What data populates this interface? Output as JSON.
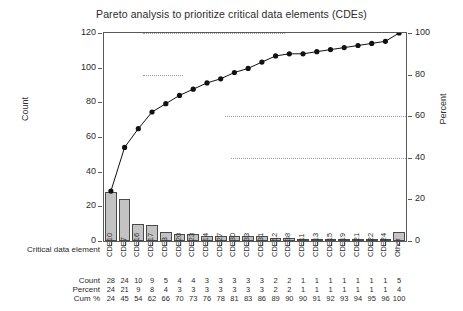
{
  "chart_data": {
    "type": "bar",
    "title": "Pareto analysis to prioritize critical data elements (CDEs)",
    "xlabel": "Critical data element",
    "ylabel": "Count",
    "y2label": "Percent",
    "ylim": [
      0,
      120
    ],
    "y2lim": [
      0,
      100
    ],
    "yticks": [
      "120",
      "100",
      "80",
      "60",
      "40",
      "20",
      "0"
    ],
    "y2ticks": [
      "100",
      "80",
      "60",
      "40",
      "20",
      "0"
    ],
    "grid": false,
    "legend": "none",
    "categories": [
      "CDE10",
      "CDE7",
      "CDE16",
      "CDE17",
      "CDE3",
      "CDE20",
      "CDE23",
      "CDE14",
      "CDE27",
      "CDE30",
      "CDE33",
      "CDE31",
      "CDE12",
      "CDE38",
      "CDE11",
      "CDE13",
      "CDE15",
      "CDE19",
      "CDE21",
      "CDE22",
      "CDE24",
      "Other"
    ],
    "values": [
      28,
      24,
      10,
      9,
      5,
      4,
      4,
      3,
      3,
      3,
      3,
      3,
      2,
      2,
      1,
      1,
      1,
      1,
      1,
      1,
      1,
      5
    ],
    "series": [
      {
        "name": "Count",
        "values": [
          28,
          24,
          10,
          9,
          5,
          4,
          4,
          3,
          3,
          3,
          3,
          3,
          2,
          2,
          1,
          1,
          1,
          1,
          1,
          1,
          1,
          5
        ]
      },
      {
        "name": "Percent",
        "values": [
          24,
          21,
          9,
          8,
          4,
          3,
          3,
          3,
          3,
          3,
          3,
          3,
          2,
          2,
          1,
          1,
          1,
          1,
          1,
          1,
          1,
          4
        ]
      },
      {
        "name": "Cum %",
        "values": [
          24,
          45,
          54,
          62,
          66,
          70,
          73,
          76,
          78,
          81,
          83,
          86,
          89,
          90,
          90,
          91,
          92,
          93,
          94,
          95,
          96,
          100
        ]
      }
    ],
    "reference_lines": [
      100,
      80,
      60,
      40
    ]
  },
  "table": {
    "row_labels": [
      "Critical data element",
      "Count",
      "Percent",
      "Cum %"
    ]
  }
}
